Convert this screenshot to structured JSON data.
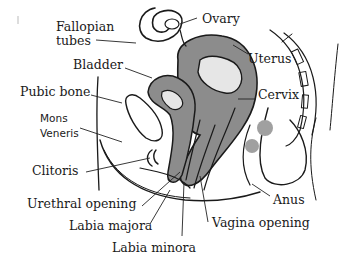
{
  "diagram": {
    "colors": {
      "ink": "#1a1a1a",
      "organ_fill": "#8c8c8c",
      "organ_light": "#d9d9d9",
      "background": "#ffffff"
    },
    "labels": {
      "fallopian_tubes_1": "Fallopian",
      "fallopian_tubes_2": "tubes",
      "ovary": "Ovary",
      "uterus": "Uterus",
      "bladder": "Bladder",
      "cervix": "Cervix",
      "pubic_bone": "Pubic bone",
      "mons_veneris_1": "Mons",
      "mons_veneris_2": "Veneris",
      "clitoris": "Clitoris",
      "urethral_opening": "Urethral opening",
      "labia_majora": "Labia majora",
      "labia_minora": "Labia minora",
      "vagina_opening": "Vagina opening",
      "anus": "Anus"
    }
  }
}
